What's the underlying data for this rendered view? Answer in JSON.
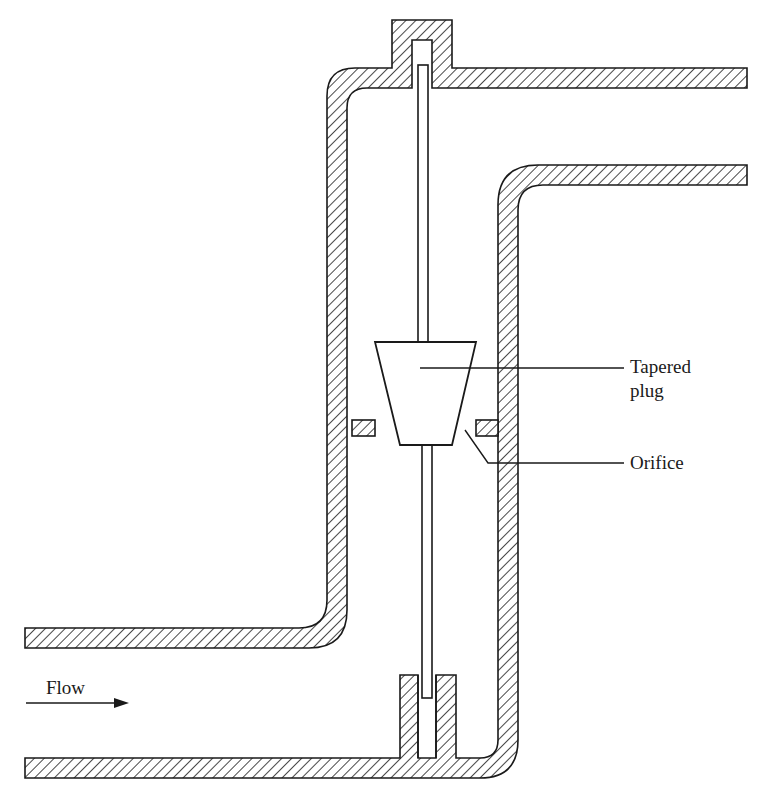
{
  "diagram": {
    "type": "cross-section",
    "labels": {
      "tapered_plug_line1": "Tapered",
      "tapered_plug_line2": "plug",
      "orifice": "Orifice",
      "flow": "Flow"
    },
    "colors": {
      "line": "#1a1a1a",
      "hatch": "#1a1a1a",
      "background": "#ffffff"
    },
    "components": [
      "inlet-pipe",
      "outlet-pipe",
      "vertical-body",
      "top-cap",
      "stem",
      "tapered-plug",
      "orifice-plate",
      "bottom-stem-guide",
      "flow-arrow"
    ]
  }
}
